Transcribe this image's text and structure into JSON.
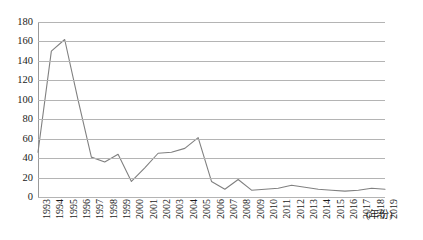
{
  "chart_data": {
    "type": "line",
    "title": "",
    "xlabel": "(年份)",
    "ylabel": "",
    "ylim": [
      0,
      180
    ],
    "ytick_step": 20,
    "yticks": [
      0,
      20,
      40,
      60,
      80,
      100,
      120,
      140,
      160,
      180
    ],
    "grid": true,
    "legend": false,
    "line_color": "#808080",
    "gridline_color": "#b4b4b4",
    "axis_color": "#9a9a9a",
    "categories": [
      "1993",
      "1994",
      "1995",
      "1996",
      "1997",
      "1998",
      "1999",
      "2000",
      "2001",
      "2002",
      "2003",
      "2004",
      "2005",
      "2006",
      "2007",
      "2008",
      "2009",
      "2010",
      "2011",
      "2012",
      "2013",
      "2014",
      "2015",
      "2016",
      "2017",
      "2018",
      "2019"
    ],
    "values": [
      46,
      150,
      162,
      100,
      41,
      36,
      44,
      16,
      30,
      45,
      46,
      50,
      61,
      16,
      8,
      18,
      7,
      8,
      9,
      12,
      10,
      8,
      7,
      6,
      7,
      9,
      8
    ],
    "series": [
      {
        "name": "",
        "values": [
          46,
          150,
          162,
          100,
          41,
          36,
          44,
          16,
          30,
          45,
          46,
          50,
          61,
          16,
          8,
          18,
          7,
          8,
          9,
          12,
          10,
          8,
          7,
          6,
          7,
          9,
          8
        ]
      }
    ]
  }
}
